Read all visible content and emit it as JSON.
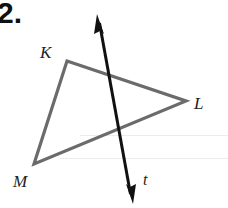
{
  "problem": {
    "number": "2."
  },
  "figure": {
    "type": "triangle with transversal line",
    "triangle": {
      "vertices": [
        {
          "name": "K",
          "x": 67,
          "y": 61
        },
        {
          "name": "L",
          "x": 186,
          "y": 101
        },
        {
          "name": "M",
          "x": 34,
          "y": 164
        }
      ],
      "stroke_color": "#6b6b6b"
    },
    "line": {
      "name": "t",
      "start": {
        "x": 98,
        "y": 15
      },
      "end": {
        "x": 132,
        "y": 203
      },
      "arrows": "both",
      "stroke_color": "#111111"
    },
    "labels": {
      "k": "K",
      "l": "L",
      "m": "M",
      "t": "t"
    }
  }
}
